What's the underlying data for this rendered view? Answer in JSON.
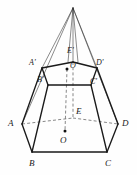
{
  "figure": {
    "canvas": {
      "width": 137,
      "height": 175
    },
    "stroke_color": "#1a1a1a",
    "dash_color": "#4a4a4a",
    "background": "#fefefe",
    "labels": [
      {
        "id": "apex-region",
        "text": ""
      },
      {
        "id": "label-A",
        "text": "A",
        "x": 8,
        "y": 119
      },
      {
        "id": "label-B",
        "text": "B",
        "x": 29,
        "y": 159
      },
      {
        "id": "label-C",
        "text": "C",
        "x": 105,
        "y": 159
      },
      {
        "id": "label-D",
        "text": "D",
        "x": 122,
        "y": 119
      },
      {
        "id": "label-E",
        "text": "E",
        "x": 76,
        "y": 107
      },
      {
        "id": "label-O",
        "text": "O",
        "x": 60,
        "y": 136
      },
      {
        "id": "label-Ap",
        "text": "A'",
        "x": 29,
        "y": 59
      },
      {
        "id": "label-Bp",
        "text": "B'",
        "x": 37,
        "y": 76
      },
      {
        "id": "label-Cp",
        "text": "C'",
        "x": 90,
        "y": 78
      },
      {
        "id": "label-Dp",
        "text": "D'",
        "x": 96,
        "y": 59
      },
      {
        "id": "label-Ep",
        "text": "E'",
        "x": 67,
        "y": 47
      },
      {
        "id": "label-Op",
        "text": "O'",
        "x": 70,
        "y": 62
      }
    ],
    "vertices": {
      "apex": {
        "x": 73,
        "y": 8
      },
      "bottom": {
        "A": {
          "x": 22,
          "y": 124
        },
        "B": {
          "x": 32,
          "y": 152
        },
        "C": {
          "x": 107,
          "y": 152
        },
        "D": {
          "x": 118,
          "y": 124
        },
        "E": {
          "x": 73,
          "y": 118
        },
        "O": {
          "x": 65,
          "y": 130
        }
      },
      "top": {
        "Ap": {
          "x": 42,
          "y": 68
        },
        "Bp": {
          "x": 48,
          "y": 85
        },
        "Cp": {
          "x": 91,
          "y": 85
        },
        "Dp": {
          "x": 97,
          "y": 68
        },
        "Ep": {
          "x": 73,
          "y": 62
        },
        "Op": {
          "x": 67,
          "y": 69
        }
      }
    },
    "edges_solid": [
      "A-B",
      "B-C",
      "C-D",
      "A-Ap",
      "B-Bp",
      "C-Cp",
      "D-Dp",
      "Ap-Bp",
      "Bp-Cp",
      "Cp-Dp",
      "Dp-Ep",
      "Ep-Ap"
    ],
    "edges_dashed": [
      "A-E",
      "E-D",
      "O-Op",
      "E-Ep",
      "E-O"
    ],
    "edges_thin": [
      "apex-A",
      "apex-B",
      "apex-C",
      "apex-D",
      "apex-E"
    ],
    "center_dots": [
      "O",
      "O'"
    ]
  }
}
